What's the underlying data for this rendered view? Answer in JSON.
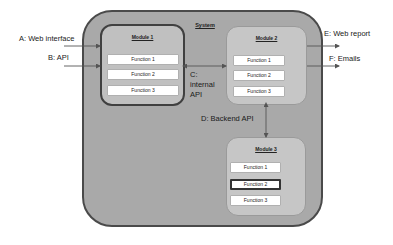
{
  "system": {
    "label": "System"
  },
  "modules": [
    {
      "title": "Module 1",
      "functions": [
        "Function 1",
        "Function 2",
        "Function 3"
      ]
    },
    {
      "title": "Module 2",
      "functions": [
        "Function 1",
        "Function 2",
        "Function 3"
      ]
    },
    {
      "title": "Module 3",
      "functions": [
        "Function 1",
        "Function 2",
        "Function 3"
      ],
      "highlighted_function": "Function 2"
    }
  ],
  "interfaces": {
    "a": "A: Web interface",
    "b": "B: API",
    "c_line1": "C:",
    "c_line2": "internal",
    "c_line3": "API",
    "d": "D: Backend API",
    "e": "E: Web report",
    "f": "F: Emails"
  },
  "colors": {
    "system_fill": "#a9a9a9",
    "system_border": "#4a4a4a",
    "module_fill": "#c6c6c6",
    "function_fill": "#ffffff",
    "arrow": "#555555"
  }
}
